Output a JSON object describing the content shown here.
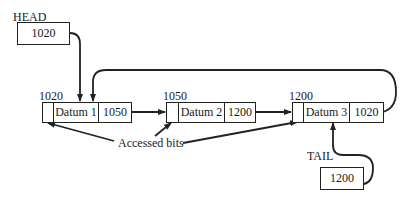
{
  "diagram": {
    "type": "circular linked list with head/tail pointers",
    "head": {
      "label": "HEAD",
      "value": "1020"
    },
    "tail": {
      "label": "TAIL",
      "value": "1200"
    },
    "nodes": [
      {
        "address": "1020",
        "datum": "Datum 1",
        "next": "1050"
      },
      {
        "address": "1050",
        "datum": "Datum 2",
        "next": "1200"
      },
      {
        "address": "1200",
        "datum": "Datum 3",
        "next": "1020"
      }
    ],
    "annotation": "Accessed bits",
    "colors": {
      "line": "#222222",
      "background": "#ffffff"
    }
  }
}
